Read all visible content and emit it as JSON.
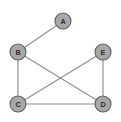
{
  "figure": {
    "kind": "undirected-graph-diagram",
    "width": 121,
    "height": 122,
    "background_color": "#ffffff"
  },
  "style": {
    "node_fill": "#a8a8a8",
    "node_stroke": "#5d5d5d",
    "node_radius": 8,
    "node_label_color": "#2b2b2b",
    "edge_color": "#8e8e8e",
    "edge_width": 1.15
  },
  "graph": {
    "nodes": [
      {
        "id": "A",
        "label": "A",
        "x": 63,
        "y": 21
      },
      {
        "id": "B",
        "label": "B",
        "x": 18,
        "y": 52
      },
      {
        "id": "E",
        "label": "E",
        "x": 103,
        "y": 52
      },
      {
        "id": "C",
        "label": "C",
        "x": 18,
        "y": 104
      },
      {
        "id": "D",
        "label": "D",
        "x": 103,
        "y": 104
      }
    ],
    "edges": [
      {
        "id": "A-B",
        "source": "A",
        "target": "B",
        "x1": 63,
        "y1": 21,
        "x2": 18,
        "y2": 52
      },
      {
        "id": "B-C",
        "source": "B",
        "target": "C",
        "x1": 18,
        "y1": 52,
        "x2": 18,
        "y2": 104
      },
      {
        "id": "B-D",
        "source": "B",
        "target": "D",
        "x1": 18,
        "y1": 52,
        "x2": 103,
        "y2": 104
      },
      {
        "id": "C-E",
        "source": "C",
        "target": "E",
        "x1": 18,
        "y1": 104,
        "x2": 103,
        "y2": 52
      },
      {
        "id": "C-D",
        "source": "C",
        "target": "D",
        "x1": 18,
        "y1": 104,
        "x2": 103,
        "y2": 104
      },
      {
        "id": "E-D",
        "source": "E",
        "target": "D",
        "x1": 103,
        "y1": 52,
        "x2": 103,
        "y2": 104
      }
    ]
  }
}
